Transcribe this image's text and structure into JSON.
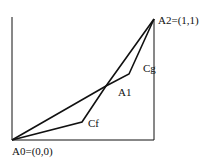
{
  "diagram": {
    "points": {
      "A0": {
        "label": "A0=(0,0)",
        "x": 12,
        "y": 140
      },
      "A1": {
        "label": "A1",
        "x": 106,
        "y": 86
      },
      "A2": {
        "label": "A2=(1,1)",
        "x": 154,
        "y": 19
      },
      "Cf": {
        "label": "Cf",
        "x": 82,
        "y": 122
      },
      "Cg": {
        "label": "Cg",
        "x": 129,
        "y": 74
      }
    },
    "stroke_color": "#111111"
  }
}
